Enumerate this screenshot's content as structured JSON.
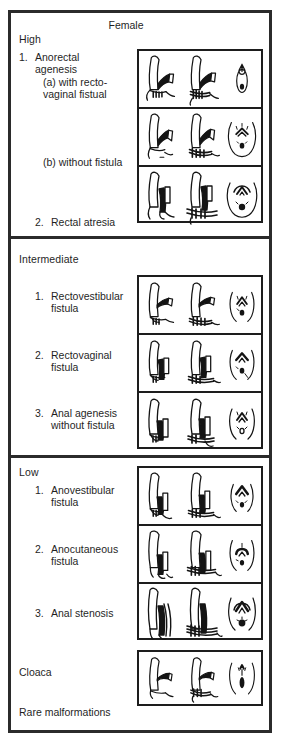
{
  "figure": {
    "title": "Female",
    "footer_note": "Rare malformations"
  },
  "sections": [
    {
      "id": "high",
      "title": "High",
      "rows": [
        {
          "num": "1.",
          "label": "Anorectal\nagenesis",
          "sublabel_a": "(a)  with recto-\n        vaginal fistual",
          "sublabel_b": "(b)  without fistula"
        },
        {
          "num": "2.",
          "label": "Rectal atresia"
        }
      ],
      "panels": [
        {
          "name": "anorectal-agenesis-with-rectovaginal-fistula",
          "views": [
            "sagittal-anatomy",
            "sagittal-anatomy-muscle",
            "perineum-slit"
          ]
        },
        {
          "name": "anorectal-agenesis-without-fistula",
          "views": [
            "sagittal-anatomy",
            "sagittal-anatomy-muscle",
            "perineum-oval"
          ]
        },
        {
          "name": "rectal-atresia",
          "views": [
            "sagittal-anatomy",
            "sagittal-anatomy-muscle",
            "perineum-oval"
          ]
        }
      ]
    },
    {
      "id": "intermediate",
      "title": "Intermediate",
      "rows": [
        {
          "num": "1.",
          "label": "Rectovestibular\nfistula"
        },
        {
          "num": "2.",
          "label": "Rectovaginal\nfistula"
        },
        {
          "num": "3.",
          "label": "Anal agenesis\nwithout fistula"
        }
      ],
      "panels": [
        {
          "name": "rectovestibular-fistula",
          "views": [
            "sagittal-anatomy",
            "sagittal-anatomy-muscle",
            "perineum-oval"
          ]
        },
        {
          "name": "rectovaginal-fistula",
          "views": [
            "sagittal-anatomy",
            "sagittal-anatomy-muscle",
            "perineum-oval"
          ]
        },
        {
          "name": "anal-agenesis-without-fistula",
          "views": [
            "sagittal-anatomy",
            "sagittal-anatomy-muscle",
            "perineum-oval"
          ]
        }
      ]
    },
    {
      "id": "low",
      "title": "Low",
      "rows": [
        {
          "num": "1.",
          "label": "Anovestibular\nfistula"
        },
        {
          "num": "2.",
          "label": "Anocutaneous\nfistula"
        },
        {
          "num": "3.",
          "label": "Anal stenosis"
        },
        {
          "num": "",
          "label": "Cloaca"
        }
      ],
      "panels": [
        {
          "name": "anovestibular-fistula",
          "views": [
            "sagittal-anatomy",
            "sagittal-anatomy-muscle",
            "perineum-oval"
          ]
        },
        {
          "name": "anocutaneous-fistula",
          "views": [
            "sagittal-anatomy",
            "sagittal-anatomy-muscle",
            "perineum-oval"
          ]
        },
        {
          "name": "anal-stenosis",
          "views": [
            "sagittal-anatomy",
            "sagittal-anatomy-muscle",
            "perineum-oval"
          ]
        },
        {
          "name": "cloaca",
          "views": [
            "sagittal-anatomy",
            "sagittal-anatomy-muscle",
            "perineum-slit"
          ]
        }
      ]
    }
  ],
  "colors": {
    "ink": "#1a1a1a",
    "frame": "#2b2b2b",
    "panel_border": "#1d1d1d",
    "background": "#ffffff"
  }
}
